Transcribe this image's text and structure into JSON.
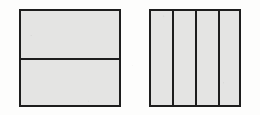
{
  "figure": {
    "caption": "",
    "background_color": "#fdfdfc",
    "fill_color": "#e4e4e3",
    "line_color": "#1d1d1d",
    "shapes": [
      {
        "name": "rectangle-halves",
        "label": "",
        "partition_direction": "horizontal",
        "parts_total": 2,
        "parts_shaded": 0,
        "fraction_label": "",
        "x": 19,
        "y": 9,
        "width": 102,
        "height": 98,
        "dividers": [
          49
        ],
        "cells": [
          {
            "label": "",
            "shaded": false
          },
          {
            "label": "",
            "shaded": false
          }
        ]
      },
      {
        "name": "square-fourths",
        "label": "",
        "partition_direction": "vertical",
        "parts_total": 4,
        "parts_shaded": 0,
        "fraction_label": "",
        "x": 149,
        "y": 9,
        "width": 92,
        "height": 98,
        "dividers": [
          23,
          46,
          69
        ],
        "cells": [
          {
            "label": "",
            "shaded": false
          },
          {
            "label": "",
            "shaded": false
          },
          {
            "label": "",
            "shaded": false
          },
          {
            "label": "",
            "shaded": false
          }
        ]
      }
    ]
  }
}
